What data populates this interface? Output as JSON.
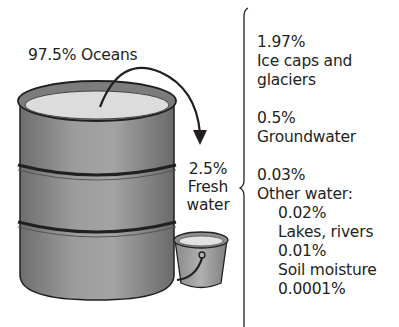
{
  "diagram": {
    "barrel_label": "97.5% Oceans",
    "bucket_label": {
      "percent": "2.5%",
      "line1": "Fresh",
      "line2": "water"
    },
    "fresh_water_breakdown": [
      {
        "percent": "1.97%",
        "lines": [
          "Ice caps and",
          "glaciers"
        ]
      },
      {
        "percent": "0.5%",
        "lines": [
          "Groundwater"
        ]
      },
      {
        "percent": "0.03%",
        "lines": [
          "Other water:"
        ],
        "sub_items": [
          {
            "percent": "0.02%",
            "label": "Lakes, rivers"
          },
          {
            "percent": "0.01%",
            "label": "Soil moisture"
          },
          {
            "percent": "0.0001%",
            "label": ""
          }
        ]
      }
    ],
    "colors": {
      "barrel_fill": "#8e8e8e",
      "water_surface": "#dcdcdc",
      "outline": "#231f20",
      "text": "#231f20"
    }
  }
}
